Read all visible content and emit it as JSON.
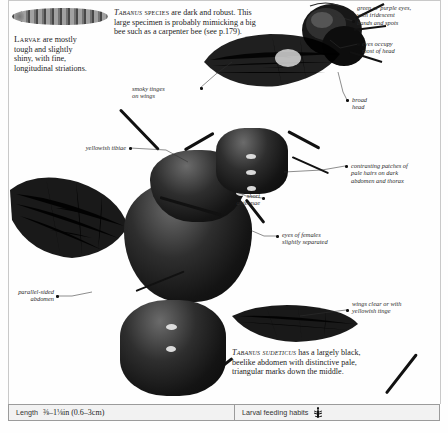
{
  "page": {
    "kind": "field-guide-spread"
  },
  "text_blocks": [
    {
      "id": "larvae_caption",
      "lead": "Larvae",
      "text": " are mostly tough and slightly shiny, with fine, longitudinal striations."
    },
    {
      "id": "tabanus_species_caption",
      "lead_italic": "Tabanus",
      "lead_caps": " species",
      "text": " are dark and robust. This large specimen is probably mimicking a big bee such as a carpenter bee (see p.179)."
    },
    {
      "id": "tabanus_sudeticus_caption",
      "lead_italic": "Tabanus sudeticus",
      "text": " has a largely black, beelike abdomen with distinctive pale, triangular marks down the middle."
    }
  ],
  "callouts": [
    {
      "id": "green_purple_eyes",
      "text": "green or purple eyes,\nwith iridescent\nbands and spots"
    },
    {
      "id": "eyes_occupy_head",
      "text": "eyes occupy\nmost of head"
    },
    {
      "id": "smoky_tinges",
      "text": "smoky tinges\non wings"
    },
    {
      "id": "broad_head",
      "text": "broad\nhead"
    },
    {
      "id": "yellowish_tibiae",
      "text": "yellowish tibiae"
    },
    {
      "id": "contrasting_patches",
      "text": "contrasting patches of\npale hairs on dark\nabdomen and thorax"
    },
    {
      "id": "short_antennae",
      "text": "short\nantennae"
    },
    {
      "id": "eyes_of_females",
      "text": "eyes of females\nslightly separated"
    },
    {
      "id": "wings_clear",
      "text": "wings clear or with\nyellowish tinge"
    },
    {
      "id": "parallel_sided_abdomen",
      "text": "parallel-sided\nabdomen"
    }
  ],
  "infobar": {
    "length_label": "Length",
    "length_value": "⅜–1⅛in (0.6–3cm)",
    "habits_label": "Larval feeding habits",
    "habits_icon": "beetle-larva-icon"
  }
}
